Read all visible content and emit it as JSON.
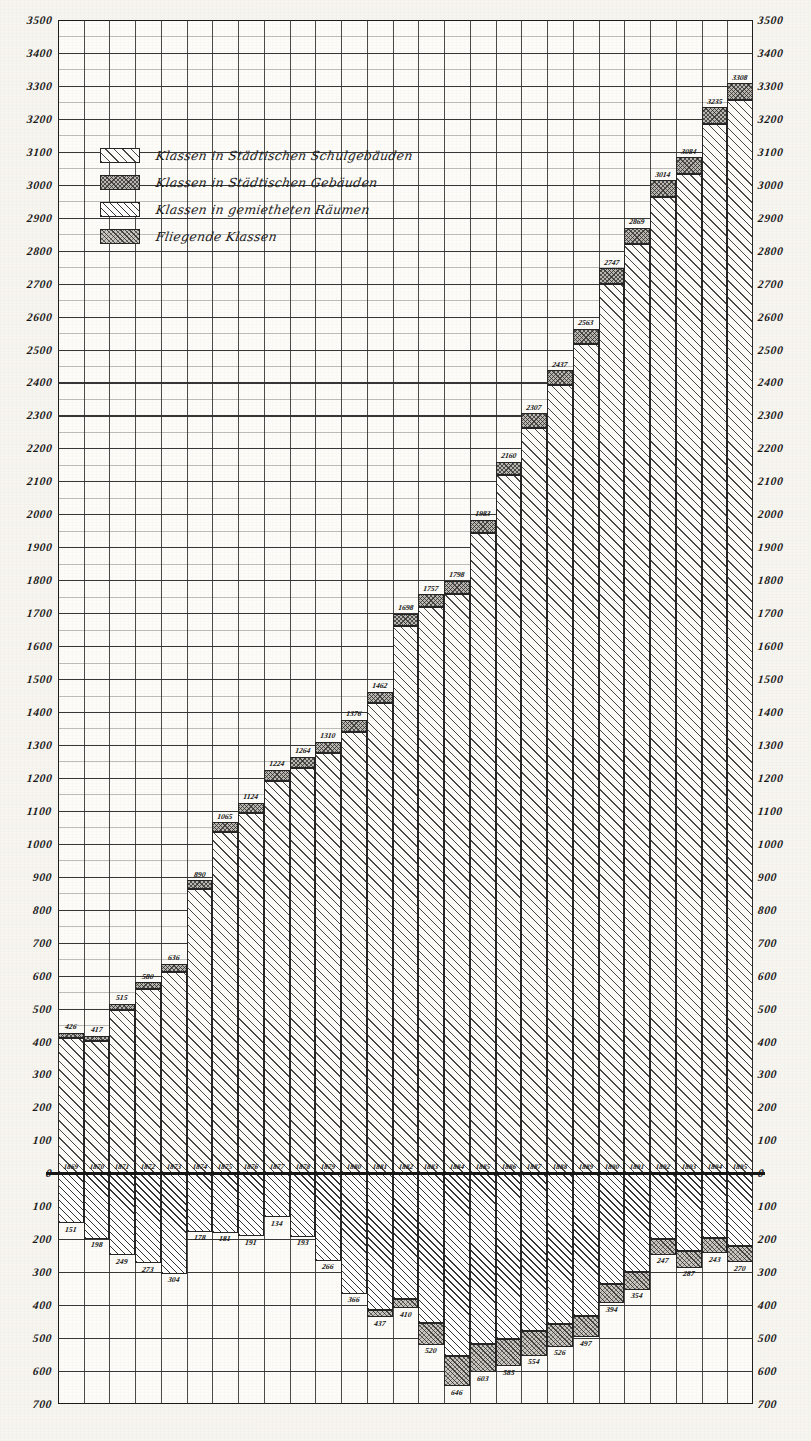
{
  "chart_data": {
    "type": "bar",
    "title": "",
    "xlabel": "",
    "ylabel": "",
    "orientation": "vertical",
    "stacked": true,
    "grid": true,
    "legend_position": "upper-left",
    "axis": {
      "y_positive_ticks": [
        0,
        100,
        200,
        300,
        400,
        500,
        600,
        700,
        800,
        900,
        1000,
        1100,
        1200,
        1300,
        1400,
        1500,
        1600,
        1700,
        1800,
        1900,
        2000,
        2100,
        2200,
        2300,
        2400,
        2500,
        2600,
        2700,
        2800,
        2900,
        3000,
        3100,
        3200,
        3300,
        3400,
        3500
      ],
      "y_negative_ticks": [
        0,
        100,
        200,
        300,
        400,
        500,
        600,
        700
      ],
      "y_positive_max": 3500,
      "y_negative_max": 700,
      "zero_label_right": "0"
    },
    "categories": [
      "1869",
      "1870",
      "1871",
      "1872",
      "1873",
      "1874",
      "1875",
      "1876",
      "1877",
      "1878",
      "1879",
      "1880",
      "1881",
      "1882",
      "1883",
      "1884",
      "1885",
      "1886",
      "1887",
      "1888",
      "1889",
      "1890",
      "1891",
      "1892",
      "1893",
      "1894",
      "1895"
    ],
    "series": [
      {
        "name": "Klassen in Städtischen Schulgebäuden",
        "key": "schulgebaeude",
        "swatch": "fill-schul",
        "direction": "up",
        "values": [
          426,
          417,
          515,
          580,
          636,
          890,
          1065,
          1124,
          1224,
          1264,
          1310,
          1376,
          1462,
          1698,
          1757,
          1798,
          1983,
          2160,
          2307,
          2437,
          2563,
          2747,
          2869,
          3014,
          3084,
          3235,
          3308
        ]
      },
      {
        "name": "Klassen in Städtischen Gebäuden",
        "key": "staedt_gebaeude",
        "swatch": "fill-staedt",
        "direction": "up-cap",
        "values": [
          14,
          16,
          20,
          22,
          26,
          28,
          30,
          30,
          32,
          34,
          34,
          36,
          36,
          38,
          38,
          40,
          40,
          42,
          44,
          44,
          46,
          48,
          48,
          50,
          50,
          52,
          52
        ]
      },
      {
        "name": "Klassen in gemietheten Räumen",
        "key": "gemiethete_raeume",
        "swatch": "fill-miet",
        "direction": "down",
        "values": [
          151,
          198,
          249,
          273,
          304,
          178,
          181,
          191,
          134,
          193,
          266,
          366,
          437,
          410,
          520,
          646,
          603,
          585,
          554,
          526,
          497,
          394,
          354,
          247,
          287,
          243,
          270
        ]
      },
      {
        "name": "Fliegende Klassen",
        "key": "fliegende_klassen",
        "swatch": "fill-flieg",
        "direction": "down-cap",
        "values": [
          0,
          0,
          0,
          0,
          0,
          0,
          0,
          0,
          0,
          0,
          0,
          0,
          22,
          30,
          66,
          92,
          86,
          82,
          76,
          70,
          64,
          58,
          54,
          48,
          52,
          46,
          50
        ]
      }
    ],
    "positive_labels": [
      {
        "year": "1869",
        "value": "426"
      },
      {
        "year": "1870",
        "value": "417"
      },
      {
        "year": "1871",
        "value": "515"
      },
      {
        "year": "1872",
        "value": "580"
      },
      {
        "year": "1873",
        "value": "636"
      },
      {
        "year": "1874",
        "value": "890"
      },
      {
        "year": "1875",
        "value": "1065"
      },
      {
        "year": "1876",
        "value": "1124"
      },
      {
        "year": "1877",
        "value": "1224"
      },
      {
        "year": "1878",
        "value": "1264"
      },
      {
        "year": "1879",
        "value": "1310"
      },
      {
        "year": "1880",
        "value": "1376"
      },
      {
        "year": "1881",
        "value": "1462"
      },
      {
        "year": "1882",
        "value": "1698"
      },
      {
        "year": "1883",
        "value": "1757"
      },
      {
        "year": "1884",
        "value": "1798"
      },
      {
        "year": "1885",
        "value": "1983"
      },
      {
        "year": "1886",
        "value": "2160"
      },
      {
        "year": "1887",
        "value": "2307"
      },
      {
        "year": "1888",
        "value": "2437"
      },
      {
        "year": "1889",
        "value": "2563"
      },
      {
        "year": "1890",
        "value": "2747"
      },
      {
        "year": "1891",
        "value": "2869"
      },
      {
        "year": "1892",
        "value": "3014"
      },
      {
        "year": "1893",
        "value": "3084"
      },
      {
        "year": "1894",
        "value": "3235"
      },
      {
        "year": "1895",
        "value": "3308"
      }
    ],
    "negative_labels": [
      {
        "year": "1869",
        "value": "151"
      },
      {
        "year": "1870",
        "value": "198"
      },
      {
        "year": "1871",
        "value": "249"
      },
      {
        "year": "1872",
        "value": "273"
      },
      {
        "year": "1873",
        "value": "304"
      },
      {
        "year": "1874",
        "value": "178"
      },
      {
        "year": "1875",
        "value": "181"
      },
      {
        "year": "1876",
        "value": "191"
      },
      {
        "year": "1877",
        "value": "134"
      },
      {
        "year": "1878",
        "value": "193"
      },
      {
        "year": "1879",
        "value": "266"
      },
      {
        "year": "1880",
        "value": "366"
      },
      {
        "year": "1881",
        "value": "437"
      },
      {
        "year": "1882",
        "value": "410"
      },
      {
        "year": "1883",
        "value": "520"
      },
      {
        "year": "1884",
        "value": "646"
      },
      {
        "year": "1885",
        "value": "603"
      },
      {
        "year": "1886",
        "value": "585"
      },
      {
        "year": "1887",
        "value": "554"
      },
      {
        "year": "1888",
        "value": "526"
      },
      {
        "year": "1889",
        "value": "497"
      },
      {
        "year": "1890",
        "value": "394"
      },
      {
        "year": "1891",
        "value": "354"
      },
      {
        "year": "1892",
        "value": "247"
      },
      {
        "year": "1893",
        "value": "287"
      },
      {
        "year": "1894",
        "value": "243"
      },
      {
        "year": "1895",
        "value": "270"
      }
    ]
  },
  "legend": {
    "items": [
      {
        "label": "Klassen in Städtischen Schulgebäuden",
        "swatch": "fill-schul"
      },
      {
        "label": "Klassen in Städtischen Gebäuden",
        "swatch": "fill-staedt"
      },
      {
        "label": "Klassen in gemietheten Räumen",
        "swatch": "fill-miet"
      },
      {
        "label": "Fliegende Klassen",
        "swatch": "fill-flieg"
      }
    ]
  },
  "colors": {
    "ink": "#1a1a1a",
    "grid": "#2b2b2b",
    "paper": "#f7f5f0",
    "plot_bg": "#fdfcf8"
  }
}
